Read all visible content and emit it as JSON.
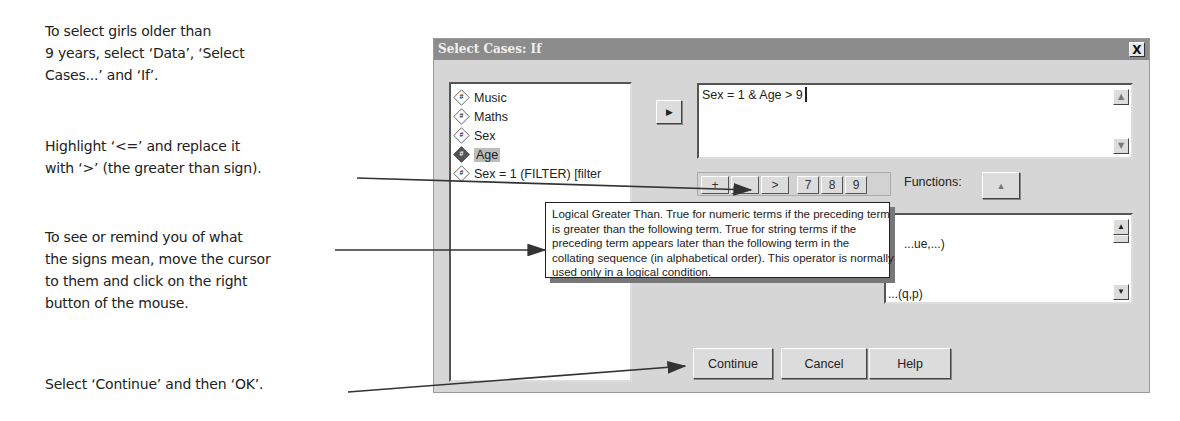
{
  "annotations": {
    "step1": [
      "To select girls older than",
      "9 years, select ‘Data’, ‘Select",
      "Cases...’ and ‘If’."
    ],
    "step2": [
      "Highlight ‘<=’ and replace it",
      "with ‘>’ (the greater than sign)."
    ],
    "step3": [
      "To see or remind you of what",
      "the signs mean, move the cursor",
      "to them and click on the right",
      "button of the mouse."
    ],
    "step4": [
      "Select ‘Continue’ and then ‘OK’."
    ]
  },
  "dialog": {
    "title": "Select Cases: If",
    "close_label": "X",
    "variables": [
      {
        "label": "Music",
        "icon": "#"
      },
      {
        "label": "Maths",
        "icon": "#"
      },
      {
        "label": "Sex",
        "icon": "#"
      },
      {
        "label": "Age",
        "icon": "#",
        "selected": true
      },
      {
        "label": "Sex = 1 (FILTER) [filter",
        "icon": "#"
      }
    ],
    "move_button_icon": "▶",
    "expression": "Sex = 1 & Age > 9",
    "keypad": [
      "+",
      "~",
      ">",
      "7",
      "8",
      "9"
    ],
    "functions_label": "Functions:",
    "functions_up_icon": "▲",
    "function_items": [
      "...ue,...)",
      "...p",
      "...(q,p)"
    ],
    "tooltip": [
      "Logical Greater Than. True for numeric terms if the preceding term",
      "is greater than the following term. True for string terms if the",
      "preceding term appears later than the following term in the",
      "collating sequence (in alphabetical order). This operator is normally",
      "used only in a logical condition."
    ],
    "buttons": {
      "continue": "Continue",
      "cancel": "Cancel",
      "help": "Help"
    }
  },
  "colors": {
    "titlebar": "#8c8c8c",
    "dialog_bg": "#d6d6d6",
    "arrow": "#333333"
  }
}
